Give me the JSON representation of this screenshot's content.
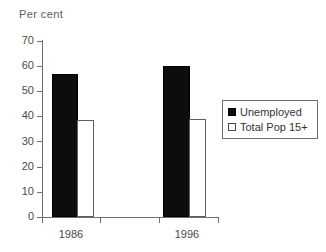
{
  "chart_data": {
    "type": "bar",
    "title": "",
    "ylabel": "Per cent",
    "xlabel": "",
    "categories": [
      "1986",
      "1996"
    ],
    "series": [
      {
        "name": "Unemployed",
        "values": [
          57,
          60
        ],
        "color": "#0d0d0d",
        "fill": "solid"
      },
      {
        "name": "Total Pop 15+",
        "values": [
          38.5,
          39
        ],
        "color": "#ffffff",
        "fill": "hollow"
      }
    ],
    "ylim": [
      0,
      70
    ],
    "ytick_step": 10,
    "yticks": [
      "70",
      "60",
      "50",
      "40",
      "30",
      "20",
      "10",
      "0"
    ],
    "grid": false,
    "legend_position": "right"
  },
  "legend": {
    "items": [
      {
        "label": "Unemployed",
        "swatch": "filled-square-icon"
      },
      {
        "label": "Total Pop 15+",
        "swatch": "hollow-square-icon"
      }
    ]
  },
  "axis": {
    "y_title": "Per cent",
    "y_labels": [
      "70",
      "60",
      "50",
      "40",
      "30",
      "20",
      "10",
      "0"
    ],
    "x_labels": [
      "1986",
      "1996"
    ]
  },
  "colors": {
    "series_unemployed": "#0d0d0d",
    "series_total_pop": "#ffffff",
    "axis": "#6e6e6e",
    "text": "#4a4a4a",
    "background": "#ffffff"
  }
}
